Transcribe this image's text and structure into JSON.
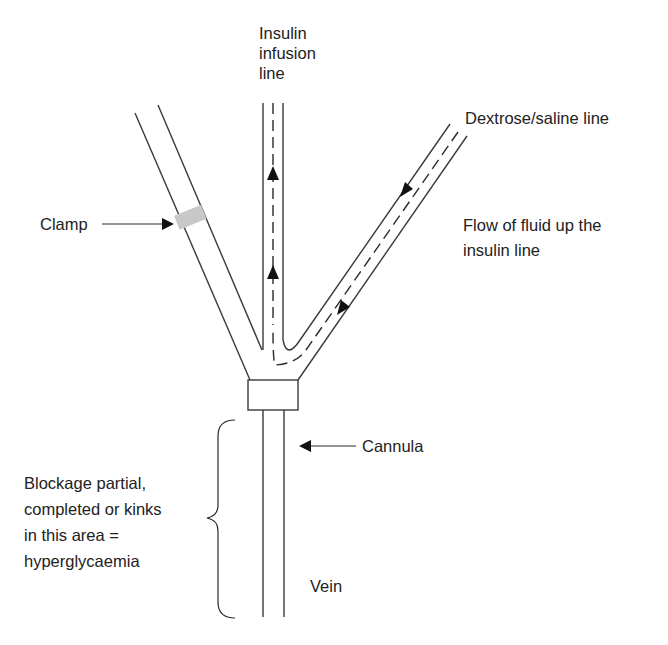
{
  "diagram": {
    "labels": {
      "insulin_line": [
        "Insulin",
        "infusion",
        "line"
      ],
      "dextrose_line": "Dextrose/saline line",
      "clamp": "Clamp",
      "flow_note": [
        "Flow of fluid up the",
        "insulin line"
      ],
      "cannula": "Cannula",
      "blockage_note": [
        "Blockage partial,",
        "completed or kinks",
        "in this area =",
        "hyperglycaemia"
      ],
      "vein": "Vein"
    },
    "components": [
      {
        "id": "insulin-line",
        "kind": "tube",
        "flow_direction": "up"
      },
      {
        "id": "dextrose-line",
        "kind": "tube",
        "flow_direction": "down-toward-junction"
      },
      {
        "id": "clamped-line",
        "kind": "tube",
        "clamped": true
      },
      {
        "id": "cannula",
        "kind": "connector"
      },
      {
        "id": "vein",
        "kind": "vessel"
      }
    ],
    "colors": {
      "line": "#3a3a3a",
      "clamp": "#c8c8c8",
      "text": "#222222"
    }
  }
}
